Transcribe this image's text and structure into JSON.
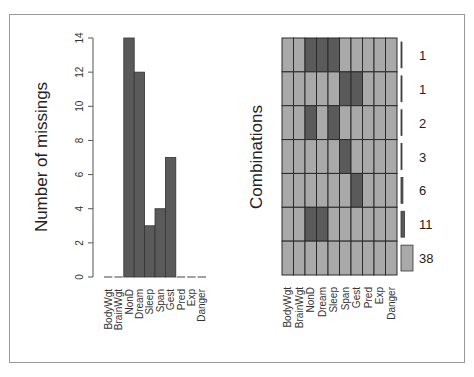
{
  "chart_data": [
    {
      "type": "bar",
      "title": "",
      "xlabel": "",
      "ylabel": "Number of missings",
      "categories": [
        "BodyWgt",
        "BrainWgt",
        "NonD",
        "Dream",
        "Sleep",
        "Span",
        "Gest",
        "Pred",
        "Exp",
        "Danger"
      ],
      "values": [
        0,
        0,
        14,
        12,
        3,
        4,
        7,
        0,
        0,
        0
      ],
      "ylim": [
        0,
        14
      ],
      "yticks": [
        0,
        2,
        4,
        6,
        8,
        10,
        12,
        14
      ],
      "grid": false,
      "bar_color": "#5a5a5a"
    },
    {
      "type": "heatmap",
      "title": "",
      "ylabel": "Combinations",
      "columns": [
        "BodyWgt",
        "BrainWgt",
        "NonD",
        "Dream",
        "Sleep",
        "Span",
        "Gest",
        "Pred",
        "Exp",
        "Danger"
      ],
      "rows": [
        {
          "count": 1,
          "missing": [
            0,
            0,
            1,
            1,
            1,
            0,
            0,
            0,
            0,
            0
          ]
        },
        {
          "count": 1,
          "missing": [
            0,
            0,
            0,
            0,
            0,
            1,
            1,
            0,
            0,
            0
          ]
        },
        {
          "count": 2,
          "missing": [
            0,
            0,
            1,
            0,
            1,
            0,
            0,
            0,
            0,
            0
          ]
        },
        {
          "count": 3,
          "missing": [
            0,
            0,
            0,
            0,
            0,
            1,
            0,
            0,
            0,
            0
          ]
        },
        {
          "count": 6,
          "missing": [
            0,
            0,
            0,
            0,
            0,
            0,
            1,
            0,
            0,
            0
          ]
        },
        {
          "count": 11,
          "missing": [
            0,
            0,
            1,
            1,
            0,
            0,
            0,
            0,
            0,
            0
          ]
        },
        {
          "count": 38,
          "missing": [
            0,
            0,
            0,
            0,
            0,
            0,
            0,
            0,
            0,
            0
          ]
        }
      ],
      "counts_labels": [
        "1",
        "1",
        "2",
        "3",
        "6",
        "11",
        "38"
      ],
      "colors": {
        "missing": "#5a5a5a",
        "observed": "#a9a9a9",
        "grid": "#2a2a2a"
      }
    }
  ],
  "labels": {
    "left_ylabel": "Number of missings",
    "right_ylabel": "Combinations"
  }
}
